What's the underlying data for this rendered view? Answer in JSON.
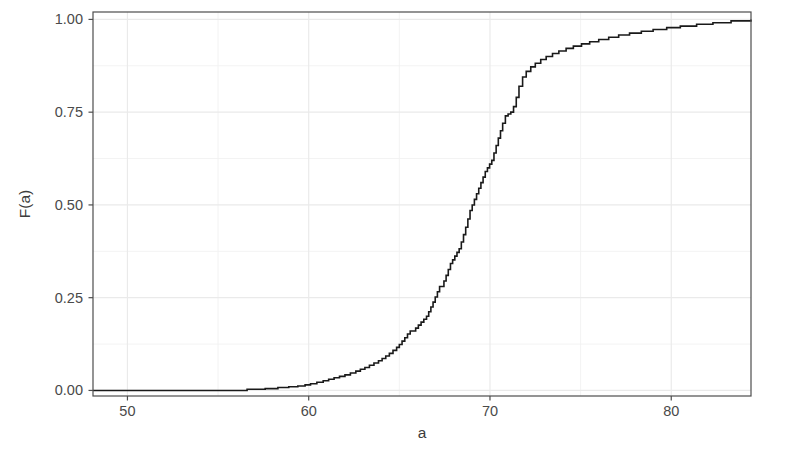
{
  "chart_data": {
    "type": "line",
    "subtype": "ecdf-step",
    "title": "",
    "subtitle": "",
    "xlabel": "a",
    "ylabel": "F(a)",
    "xlim": [
      48.1,
      84.4
    ],
    "ylim": [
      -0.015,
      1.02
    ],
    "xticks": [
      50,
      60,
      70,
      80
    ],
    "xtick_labels": [
      "50",
      "60",
      "70",
      "80"
    ],
    "yticks": [
      0.0,
      0.25,
      0.5,
      0.75,
      1.0
    ],
    "ytick_labels": [
      "0.00",
      "0.25",
      "0.50",
      "0.75",
      "1.00"
    ],
    "grid": true,
    "grid_major": true,
    "grid_minor": true,
    "legend": "none",
    "line_color": "#1a1a1a",
    "line_width": 1.6,
    "panel_background": "#ffffff",
    "panel_border_color": "#4d4d4d",
    "grid_color": "#f2f2f2",
    "series": [
      {
        "name": "F(a)",
        "x": [
          48.1,
          53.2,
          55.4,
          56.6,
          57.6,
          58.3,
          58.9,
          59.4,
          59.8,
          60.1,
          60.45,
          60.8,
          61.1,
          61.4,
          61.7,
          62.0,
          62.3,
          62.6,
          62.85,
          63.1,
          63.35,
          63.6,
          63.85,
          64.05,
          64.25,
          64.45,
          64.65,
          64.85,
          65.0,
          65.15,
          65.3,
          65.45,
          65.6,
          65.75,
          65.9,
          66.05,
          66.2,
          66.35,
          66.5,
          66.62,
          66.74,
          66.86,
          66.98,
          67.1,
          67.22,
          67.34,
          67.46,
          67.58,
          67.7,
          67.82,
          67.94,
          68.06,
          68.18,
          68.3,
          68.42,
          68.54,
          68.66,
          68.78,
          68.9,
          69.02,
          69.14,
          69.26,
          69.38,
          69.5,
          69.62,
          69.74,
          69.86,
          69.98,
          70.1,
          70.22,
          70.34,
          70.46,
          70.58,
          70.7,
          70.85,
          71.0,
          71.15,
          71.3,
          71.45,
          71.6,
          71.8,
          72.0,
          72.25,
          72.5,
          72.8,
          73.1,
          73.45,
          73.8,
          74.2,
          74.6,
          75.05,
          75.5,
          76.0,
          76.55,
          77.1,
          77.7,
          78.35,
          79.0,
          79.75,
          80.5,
          81.4,
          82.3,
          83.3,
          84.4
        ],
        "y": [
          0.0,
          0.0,
          0.0,
          0.003,
          0.005,
          0.008,
          0.01,
          0.012,
          0.015,
          0.018,
          0.022,
          0.026,
          0.03,
          0.034,
          0.038,
          0.042,
          0.047,
          0.052,
          0.057,
          0.062,
          0.068,
          0.074,
          0.08,
          0.086,
          0.093,
          0.1,
          0.108,
          0.116,
          0.124,
          0.133,
          0.142,
          0.152,
          0.16,
          0.16,
          0.168,
          0.176,
          0.184,
          0.192,
          0.2,
          0.212,
          0.225,
          0.238,
          0.252,
          0.266,
          0.28,
          0.28,
          0.295,
          0.31,
          0.326,
          0.342,
          0.352,
          0.362,
          0.372,
          0.382,
          0.4,
          0.42,
          0.44,
          0.462,
          0.485,
          0.5,
          0.515,
          0.53,
          0.545,
          0.56,
          0.575,
          0.59,
          0.6,
          0.61,
          0.62,
          0.64,
          0.66,
          0.68,
          0.7,
          0.72,
          0.74,
          0.745,
          0.75,
          0.765,
          0.79,
          0.82,
          0.845,
          0.86,
          0.872,
          0.882,
          0.892,
          0.9,
          0.908,
          0.915,
          0.922,
          0.928,
          0.934,
          0.94,
          0.946,
          0.952,
          0.958,
          0.963,
          0.968,
          0.973,
          0.978,
          0.982,
          0.987,
          0.991,
          0.996,
          1.0
        ]
      }
    ]
  },
  "axis": {
    "y_title": "F(a)",
    "x_title": "a",
    "x_tick_labels": [
      "50",
      "60",
      "70",
      "80"
    ],
    "y_tick_labels": [
      "0.00",
      "0.25",
      "0.50",
      "0.75",
      "1.00"
    ]
  }
}
